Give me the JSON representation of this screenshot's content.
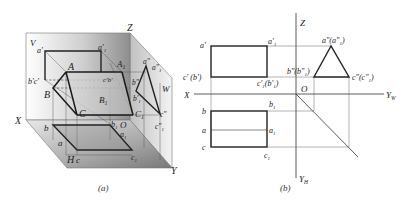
{
  "figure": {
    "panel_a": {
      "caption": "(a)",
      "planes": {
        "v": "V",
        "h": "H",
        "w": "W"
      },
      "axes": {
        "x": "X",
        "y": "Y",
        "z": "Z",
        "origin": "O"
      },
      "solid_labels": {
        "A": "A",
        "B": "B",
        "C": "C",
        "A1": "A",
        "A1_sub": "1",
        "B1": "B",
        "B1_sub": "1",
        "C1": "C",
        "C1_sub": "1"
      },
      "front_labels": {
        "a_prime": "a'",
        "a1_prime": "a'",
        "a1_sub": "1",
        "bc_prime": "b'c'",
        "c1b1_prime": "c'",
        "c1b1_rest": "b'"
      },
      "side_labels": {
        "a_dprime": "a\"",
        "a1_dprime": "a\"",
        "a1_dsub": "1",
        "b_dprime": "b\"",
        "b1_dprime": "b'",
        "b1_dsub": "1",
        "c_dprime": "c\"",
        "c1_dprime": "c\"",
        "c1_dsub": "1"
      },
      "top_labels": {
        "a": "a",
        "b": "b",
        "c": "c",
        "a1": "a",
        "b1": "b",
        "c1": "c",
        "sub": "1"
      }
    },
    "panel_b": {
      "caption": "(b)",
      "axes": {
        "x": "X",
        "z": "Z",
        "yw": "Y",
        "yw_sub": "W",
        "yh": "Y",
        "yh_sub": "H",
        "origin": "O"
      },
      "front_view": {
        "a_prime": "a'",
        "a1_prime": "a'",
        "a1_sub": "1",
        "cb_prime": "c' (b')",
        "c1b1_prime": "c'",
        "c1b1_rest": "(b'",
        "c1b1_tail": ")"
      },
      "side_view": {
        "apex": "a\"(a\"",
        "apex_sub": "1",
        "apex_tail": ")",
        "left": "b\"(b\"",
        "left_sub": "1",
        "left_tail": ")",
        "right": "c\"(c\"",
        "right_sub": "1",
        "right_tail": ")"
      },
      "top_view": {
        "b": "b",
        "a": "a",
        "c": "c",
        "b1": "b",
        "a1": "a",
        "c1": "c",
        "sub": "1"
      }
    }
  }
}
